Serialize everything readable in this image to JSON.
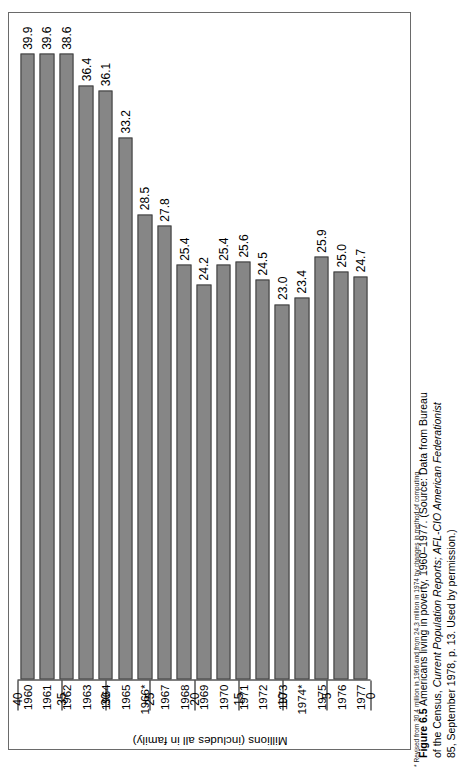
{
  "figure": {
    "label": "Figure 6.5",
    "caption_main": "Americans living in poverty, 1960–1977.",
    "source_open": "(Source: Data from Bureau of the Census,",
    "source_italic_1": "Current Population Reports;",
    "source_italic_2": "AFL-CIO American Federationist",
    "source_tail": "85, September 1978, p. 13.  Used by permission.)",
    "footnote": "* Revised from 30.4 million in 1966 and from 24.3 million in 1974 by changes in method of computing."
  },
  "colors": {
    "bar_fill": "#868686",
    "bar_stroke": "#3d3d3d",
    "frame": "#6a6a6a",
    "text": "#000000"
  },
  "chart_data": {
    "type": "bar",
    "title": "Americans living in poverty, 1960–1977",
    "orientation": "vertical",
    "xlabel": "",
    "ylabel": "Millions (includes all in family)",
    "ylim": [
      0,
      40
    ],
    "yticks": [
      0,
      5,
      10,
      15,
      20,
      25,
      30,
      35,
      40
    ],
    "ytick_labels": [
      "0",
      "5",
      "10",
      "15",
      "20",
      "25",
      "30",
      "35",
      "40"
    ],
    "grid": false,
    "legend": "none",
    "categories": [
      "1960",
      "1961",
      "1962",
      "1963",
      "1964",
      "1965",
      "1966*",
      "1967",
      "1968",
      "1969",
      "1970",
      "1971",
      "1972",
      "1973",
      "1974*",
      "1975",
      "1976",
      "1977"
    ],
    "values": [
      39.9,
      39.6,
      38.6,
      36.4,
      36.1,
      33.2,
      28.5,
      27.8,
      25.4,
      24.2,
      25.4,
      25.6,
      24.5,
      23.0,
      23.4,
      25.9,
      25.0,
      24.7
    ],
    "data_labels": [
      "39.9",
      "39.6",
      "38.6",
      "36.4",
      "36.1",
      "33.2",
      "28.5",
      "27.8",
      "25.4",
      "24.2",
      "25.4",
      "25.6",
      "24.5",
      "23.0",
      "23.4",
      "25.9",
      "25.0",
      "24.7"
    ],
    "annotations": [
      "* Revised from 30.4 million in 1966 and from 24.3 million in 1974 by changes in method of computing."
    ]
  }
}
